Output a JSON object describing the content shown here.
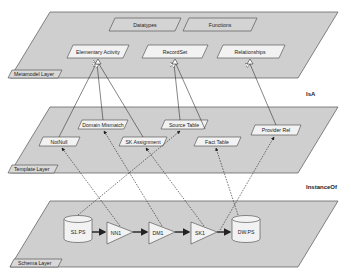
{
  "layers": {
    "metamodel": {
      "label": "Metamodel Layer",
      "top_row": [
        "Datatypes",
        "Functions"
      ],
      "bottom_row": [
        "Elementary Activity",
        "RecordSet",
        "Relationships"
      ]
    },
    "template": {
      "label": "Template Layer",
      "nodes": [
        "Domain Mismatch",
        "Source Table",
        "NotNull",
        "SK Assignment",
        "Fact Table",
        "Provider Rel"
      ]
    },
    "schema": {
      "label": "Schema Layer",
      "datastores": [
        "S1.PS",
        "DW.PS"
      ],
      "activities": [
        "NN1",
        "DM1",
        "SK1"
      ]
    }
  },
  "relations": {
    "isa": "IsA",
    "instance_of": "InstanceOf"
  },
  "colors": {
    "plane_fill": "#cfcfcf",
    "node_fill": "#f2f2f2",
    "stroke": "#444444"
  }
}
